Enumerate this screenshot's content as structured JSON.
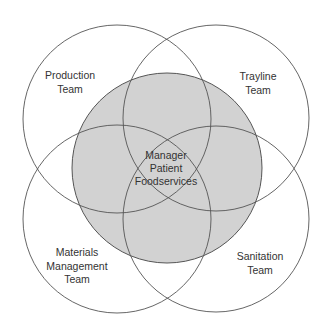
{
  "diagram": {
    "type": "venn",
    "colors": {
      "center_fill": "#d2d2d2",
      "stroke": "#555555",
      "text": "#333333",
      "background": "#ffffff"
    },
    "center": {
      "lines": [
        "Manager",
        "Patient",
        "Foodservices"
      ]
    },
    "teams": [
      {
        "position": "top-left",
        "lines": [
          "Production",
          "Team"
        ]
      },
      {
        "position": "top-right",
        "lines": [
          "Trayline",
          "Team"
        ]
      },
      {
        "position": "bottom-left",
        "lines": [
          "Materials",
          "Management",
          "Team"
        ]
      },
      {
        "position": "bottom-right",
        "lines": [
          "Sanitation",
          "Team"
        ]
      }
    ]
  }
}
